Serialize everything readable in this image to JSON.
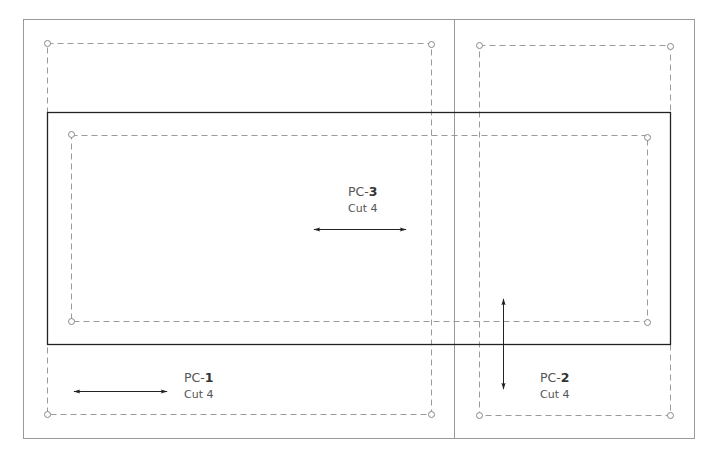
{
  "pattern": {
    "pieces": [
      {
        "id": "pc1",
        "prefix": "PC-",
        "number": "1",
        "cut": "Cut 4",
        "grain": "horizontal"
      },
      {
        "id": "pc2",
        "prefix": "PC-",
        "number": "2",
        "cut": "Cut 4",
        "grain": "vertical"
      },
      {
        "id": "pc3",
        "prefix": "PC-",
        "number": "3",
        "cut": "Cut 4",
        "grain": "horizontal"
      }
    ]
  },
  "colors": {
    "frame": "#9a9a9a",
    "solid": "#222222",
    "dashed": "#9a9a9a",
    "arrow": "#222222"
  }
}
